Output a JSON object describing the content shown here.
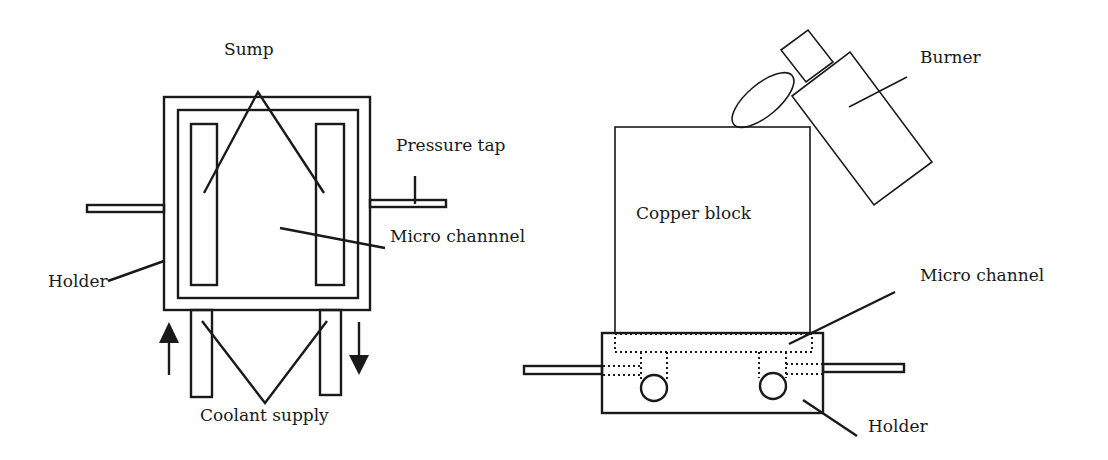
{
  "figure": {
    "left_view": {
      "title": "Top view of micro channel holder",
      "labels": {
        "sump": "Sump",
        "pressure_tap": "Pressure tap",
        "micro_channel": "Micro channnel",
        "holder": "Holder",
        "coolant_supply": "Coolant supply"
      },
      "flow_arrows": [
        "up",
        "down"
      ]
    },
    "right_view": {
      "title": "Side view with copper block and burner",
      "labels": {
        "burner": "Burner",
        "copper_block": "Copper block",
        "micro_channel": "Micro channel",
        "holder": "Holder"
      }
    },
    "colors": {
      "line": "#1a1a1a",
      "background": "#ffffff"
    }
  }
}
